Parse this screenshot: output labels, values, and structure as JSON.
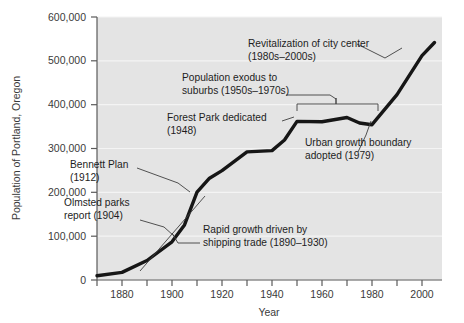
{
  "chart_data": {
    "type": "line",
    "title": "",
    "xlabel": "Year",
    "ylabel": "Population of Portland, Oregon",
    "xlim": [
      1870,
      2008
    ],
    "ylim": [
      0,
      620000
    ],
    "grid": true,
    "legend_position": "none",
    "x_ticks_major": [
      1880,
      1900,
      1920,
      1940,
      1960,
      1980,
      2000
    ],
    "x_ticks_minor": [
      1870,
      1890,
      1910,
      1930,
      1950,
      1970,
      1990
    ],
    "y_ticks": [
      0,
      100000,
      200000,
      300000,
      400000,
      500000,
      600000
    ],
    "y_tick_labels": [
      "0",
      "100,000",
      "200,000",
      "300,000",
      "400,000",
      "500,000",
      "600,000"
    ],
    "series": [
      {
        "name": "Population of Portland, Oregon",
        "x": [
          1870,
          1880,
          1890,
          1900,
          1905,
          1910,
          1915,
          1920,
          1930,
          1940,
          1945,
          1950,
          1960,
          1970,
          1975,
          1980,
          1990,
          2000,
          2005
        ],
        "values": [
          10000,
          18000,
          46000,
          90000,
          130000,
          207000,
          240000,
          258000,
          302000,
          305000,
          330000,
          374000,
          373000,
          383000,
          370000,
          366000,
          437000,
          529000,
          560000
        ]
      }
    ],
    "annotations": [
      {
        "id": "revitalization",
        "lines": [
          "Revitalization of city center",
          "(1980s–2000s)"
        ],
        "target_year": 1993,
        "target_value": 470000
      },
      {
        "id": "population-exodus",
        "lines": [
          "Population exodus to",
          "suburbs (1950s–1970s)"
        ],
        "span_years": [
          1950,
          1980
        ],
        "target_value": 400000
      },
      {
        "id": "forest-park",
        "lines": [
          "Forest Park dedicated",
          "(1948)"
        ],
        "target_year": 1950,
        "target_value": 374000
      },
      {
        "id": "urban-growth-boundary",
        "lines": [
          "Urban growth boundary",
          "adopted (1979)"
        ],
        "target_year": 1980,
        "target_value": 366000
      },
      {
        "id": "bennett-plan",
        "lines": [
          "Bennett Plan",
          "(1912)"
        ],
        "target_year": 1912,
        "target_value": 218000
      },
      {
        "id": "olmsted-parks",
        "lines": [
          "Olmsted parks",
          "report (1904)"
        ],
        "target_year": 1905,
        "target_value": 128000
      },
      {
        "id": "rapid-growth",
        "lines": [
          "Rapid growth driven by",
          "shipping trade (1890–1930)"
        ],
        "span_years": [
          1890,
          1930
        ]
      }
    ]
  },
  "axes": {
    "y_label": "Population of Portland, Oregon",
    "x_label": "Year",
    "y_tick_0": "0",
    "y_tick_1": "100,000",
    "y_tick_2": "200,000",
    "y_tick_3": "300,000",
    "y_tick_4": "400,000",
    "y_tick_5": "500,000",
    "y_tick_6": "600,000",
    "x_tick_0": "1880",
    "x_tick_1": "1900",
    "x_tick_2": "1920",
    "x_tick_3": "1940",
    "x_tick_4": "1960",
    "x_tick_5": "1980",
    "x_tick_6": "2000"
  },
  "annotations_text": {
    "revitalization_l1": "Revitalization of city center",
    "revitalization_l2": "(1980s–2000s)",
    "exodus_l1": "Population exodus to",
    "exodus_l2": "suburbs (1950s–1970s)",
    "forest_park_l1": "Forest Park dedicated",
    "forest_park_l2": "(1948)",
    "ugb_l1": "Urban growth boundary",
    "ugb_l2": "adopted (1979)",
    "bennett_l1": "Bennett Plan",
    "bennett_l2": "(1912)",
    "olmsted_l1": "Olmsted parks",
    "olmsted_l2": "report (1904)",
    "rapid_l1": "Rapid growth driven by",
    "rapid_l2": "shipping trade (1890–1930)"
  },
  "colors": {
    "plot_background": "#e4e4e4",
    "gridline": "#f2f2f2",
    "series_line": "#1a1a1a",
    "axis": "#5a5a5a",
    "text": "#2b2b2b",
    "leader_line": "#4a4a4a"
  }
}
